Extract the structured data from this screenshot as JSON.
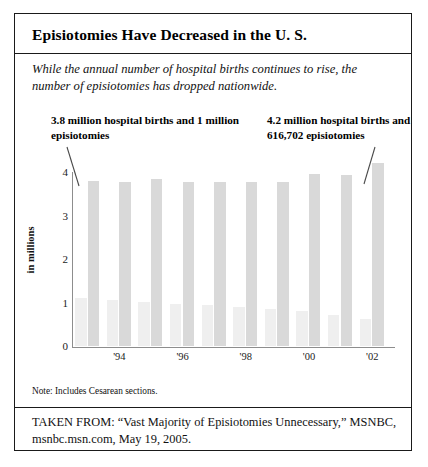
{
  "figure": {
    "title": "Episiotomies Have Decreased in the U. S.",
    "subtitle": "While the annual number of hospital births continues to rise, the number of episiotomies has dropped nationwide.",
    "note": "Note: Includes Cesarean sections.",
    "source": "TAKEN FROM: “Vast Majority of Episiotomies Unnecessary,” MSNBC, msnbc.msn.com, May 19, 2005."
  },
  "annotations": {
    "left": "3.8 million hospital births and 1 million episiotomies",
    "right": "4.2 million hospital births and 616,702 episiotomies"
  },
  "colors": {
    "births_bar": "#d9d9d9",
    "episiotomies_bar": "#efefef",
    "axis": "#8d8d8d",
    "border": "#1a1a1a"
  },
  "chart_data": {
    "type": "bar",
    "title": "Episiotomies Have Decreased in the U. S.",
    "xlabel": "",
    "ylabel": "in millions",
    "ylim": [
      0,
      4
    ],
    "yticks": [
      0,
      1,
      2,
      3,
      4
    ],
    "ytick_labels": [
      "0",
      "1",
      "2",
      "3",
      "4"
    ],
    "grid": false,
    "legend": "none",
    "categories": [
      "1993",
      "1994",
      "1995",
      "1996",
      "1997",
      "1998",
      "1999",
      "2000",
      "2001",
      "2002"
    ],
    "xtick_labels": [
      "'94",
      "'96",
      "'98",
      "'00",
      "'02"
    ],
    "xtick_categories": [
      "1994",
      "1996",
      "1998",
      "2000",
      "2002"
    ],
    "series": [
      {
        "name": "episiotomies",
        "values": [
          1.1,
          1.05,
          1.02,
          0.97,
          0.95,
          0.9,
          0.85,
          0.8,
          0.72,
          0.62
        ]
      },
      {
        "name": "hospital births",
        "values": [
          3.8,
          3.78,
          3.84,
          3.76,
          3.78,
          3.77,
          3.78,
          3.95,
          3.93,
          4.2
        ]
      }
    ]
  }
}
